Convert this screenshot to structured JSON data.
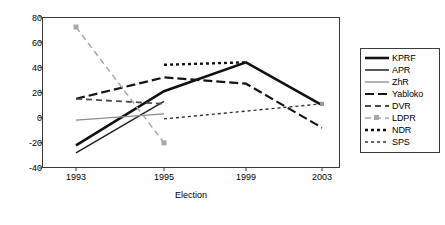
{
  "chart_data": {
    "type": "line",
    "title": "",
    "xlabel": "Election",
    "ylabel": "",
    "categories": [
      "1993",
      "1995",
      "1999",
      "2003"
    ],
    "x_positions": [
      76,
      164,
      246,
      322
    ],
    "ylim": [
      -40,
      80
    ],
    "yticks": [
      -40,
      -20,
      0,
      20,
      40,
      60,
      80
    ],
    "ytick_labels": [
      "-40",
      "-20",
      "0",
      "20",
      "40",
      "60",
      "80"
    ],
    "grid": false,
    "legend_position": "right",
    "series": [
      {
        "name": "KPRF",
        "values": [
          -22,
          21,
          44,
          10
        ],
        "color": "#111111",
        "style": "solid",
        "width": 2.6,
        "marker": "none"
      },
      {
        "name": "APR",
        "values": [
          -28,
          13,
          null,
          null
        ],
        "color": "#222222",
        "style": "solid",
        "width": 1.5,
        "marker": "none"
      },
      {
        "name": "ZhR",
        "values": [
          -2,
          3,
          null,
          null
        ],
        "color": "#8c8c8c",
        "style": "solid",
        "width": 1.3,
        "marker": "none"
      },
      {
        "name": "Yabloko",
        "values": [
          15,
          32,
          27,
          -8
        ],
        "color": "#151515",
        "style": "dashed-long",
        "width": 2.2,
        "marker": "none"
      },
      {
        "name": "DVR",
        "values": [
          15,
          11,
          null,
          null
        ],
        "color": "#4a4a4a",
        "style": "dashed-medium",
        "width": 1.8,
        "marker": "none"
      },
      {
        "name": "LDPR",
        "values": [
          72,
          -20,
          null,
          null
        ],
        "color": "#a8a8a8",
        "style": "dashed-medium",
        "width": 1.5,
        "marker": "square"
      },
      {
        "name": "NDR",
        "values": [
          null,
          42,
          44,
          null
        ],
        "color": "#111111",
        "style": "dotted-thick",
        "width": 2.4,
        "marker": "none"
      },
      {
        "name": "SPS",
        "values": [
          null,
          -1,
          null,
          11
        ],
        "color": "#333333",
        "style": "dotted-thin",
        "width": 1.4,
        "marker": "none"
      }
    ]
  },
  "axes": {
    "x_title": "Election",
    "x_tick_labels": [
      "1993",
      "1995",
      "1999",
      "2003"
    ],
    "y_tick_labels": [
      "80",
      "60",
      "40",
      "20",
      "0",
      "-20",
      "-40"
    ]
  },
  "legend": {
    "items": [
      {
        "label": "KPRF"
      },
      {
        "label": "APR"
      },
      {
        "label": "ZhR"
      },
      {
        "label": "Yabloko"
      },
      {
        "label": "DVR"
      },
      {
        "label": "LDPR"
      },
      {
        "label": "NDR"
      },
      {
        "label": "SPS"
      }
    ]
  }
}
